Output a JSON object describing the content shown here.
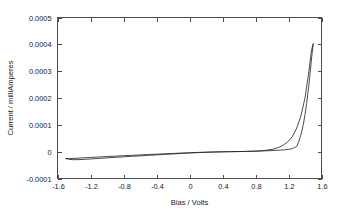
{
  "chart_data": {
    "type": "line",
    "title": "",
    "xlabel": "Bias / Volts",
    "ylabel": "Current / milliAmperes",
    "xlim": [
      -1.6,
      1.6
    ],
    "ylim": [
      -0.0001,
      0.0005
    ],
    "xticks": [
      -1.6,
      -1.2,
      -0.8,
      -0.4,
      0,
      0.4,
      0.8,
      1.2,
      1.6
    ],
    "xtick_labels": [
      "-1.6",
      "-1.2",
      "-0.8",
      "-0.4",
      "0",
      "0.4",
      "0.8",
      "1.2",
      "1.6"
    ],
    "yticks": [
      -0.0001,
      0,
      0.0001,
      0.0002,
      0.0003,
      0.0004,
      0.0005
    ],
    "ytick_labels": [
      "-0.0001",
      "0",
      "0.0001",
      "0.0002",
      "0.0003",
      "0.0004",
      "0.0005"
    ],
    "grid": false,
    "legend": false,
    "legend_position": "none",
    "line_color": "#2b2b2b",
    "frame_color": "#4d4d4d",
    "series": [
      {
        "name": "forward sweep",
        "x": [
          -1.5,
          -1.45,
          -1.4,
          -1.3,
          -1.2,
          -1.1,
          -1.0,
          -0.9,
          -0.8,
          -0.7,
          -0.6,
          -0.5,
          -0.4,
          -0.3,
          -0.2,
          -0.1,
          0.0,
          0.1,
          0.2,
          0.3,
          0.4,
          0.5,
          0.6,
          0.7,
          0.8,
          0.9,
          1.0,
          1.05,
          1.1,
          1.15,
          1.2,
          1.25,
          1.3,
          1.35,
          1.4,
          1.45,
          1.48,
          1.5
        ],
        "y": [
          -2.55e-05,
          -2.6e-05,
          -2.5e-05,
          -2.32e-05,
          -2.15e-05,
          -1.98e-05,
          -1.82e-05,
          -1.66e-05,
          -1.5e-05,
          -1.36e-05,
          -1.22e-05,
          -1.08e-05,
          -9.4e-06,
          -8e-06,
          -6.6e-06,
          -5.2e-06,
          -4e-06,
          -2.8e-06,
          -1.8e-06,
          -1e-06,
          -4e-07,
          0.0,
          4e-07,
          1e-06,
          2e-06,
          4e-06,
          8.5e-06,
          1.25e-05,
          1.85e-05,
          2.7e-05,
          3.9e-05,
          5.8e-05,
          8.8e-05,
          0.000133,
          0.0002,
          0.000305,
          0.00038,
          0.000402
        ]
      },
      {
        "name": "reverse sweep",
        "x": [
          1.5,
          1.48,
          1.45,
          1.42,
          1.4,
          1.38,
          1.36,
          1.34,
          1.32,
          1.3,
          1.25,
          1.2,
          1.15,
          1.1,
          1.05,
          1.0,
          0.9,
          0.8,
          0.7,
          0.6,
          0.5,
          0.4,
          0.3,
          0.2,
          0.1,
          0.0,
          -0.1,
          -0.2,
          -0.3,
          -0.4,
          -0.5,
          -0.6,
          -0.7,
          -0.8,
          -0.9,
          -1.0,
          -1.1,
          -1.2,
          -1.3,
          -1.4,
          -1.45,
          -1.5
        ],
        "y": [
          0.000402,
          0.00035,
          0.000255,
          0.00018,
          0.000138,
          0.000102,
          7.4e-05,
          5.2e-05,
          3.4e-05,
          2e-05,
          1.15e-05,
          8.5e-06,
          7e-06,
          5.8e-06,
          4.8e-06,
          4e-06,
          2.8e-06,
          1.8e-06,
          1e-06,
          4e-07,
          0.0,
          -6e-07,
          -1.4e-06,
          -2.4e-06,
          -3.6e-06,
          -5e-06,
          -6.6e-06,
          -8.4e-06,
          -1.02e-05,
          -1.2e-05,
          -1.38e-05,
          -1.56e-05,
          -1.74e-05,
          -1.92e-05,
          -2.12e-05,
          -2.32e-05,
          -2.52e-05,
          -2.72e-05,
          -2.92e-05,
          -3e-05,
          -2.9e-05,
          -2.55e-05
        ]
      }
    ]
  }
}
